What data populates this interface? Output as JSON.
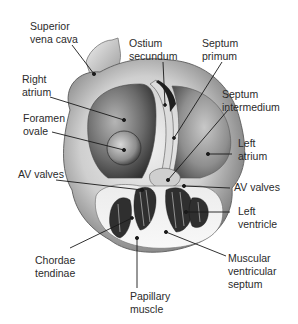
{
  "figure": {
    "colors": {
      "background": "#ffffff",
      "text": "#2b2b2b",
      "leader": "#1a1a1a",
      "tissue_light": "#e6e6e6",
      "tissue_mid": "#a8a8a8",
      "tissue_dark": "#3a3a3a"
    },
    "labels": [
      {
        "id": "superior-vena-cava",
        "lines": [
          "Superior",
          "vena cava"
        ]
      },
      {
        "id": "ostium-secundum",
        "lines": [
          "Ostium",
          "secundum"
        ]
      },
      {
        "id": "septum-primum",
        "lines": [
          "Septum",
          "primum"
        ]
      },
      {
        "id": "right-atrium",
        "lines": [
          "Right",
          "atrium"
        ]
      },
      {
        "id": "septum-intermedium",
        "lines": [
          "Septum",
          "intermedium"
        ]
      },
      {
        "id": "foramen-ovale",
        "lines": [
          "Foramen",
          "ovale"
        ]
      },
      {
        "id": "left-atrium",
        "lines": [
          "Left",
          "atrium"
        ]
      },
      {
        "id": "av-valves-left",
        "lines": [
          "AV valves"
        ]
      },
      {
        "id": "av-valves-right",
        "lines": [
          "AV valves"
        ]
      },
      {
        "id": "left-ventricle",
        "lines": [
          "Left",
          "ventricle"
        ]
      },
      {
        "id": "chordae-tendinae",
        "lines": [
          "Chordae",
          "tendinae"
        ]
      },
      {
        "id": "muscular-ventricular-septum",
        "lines": [
          "Muscular",
          "ventricular",
          "septum"
        ]
      },
      {
        "id": "papillary-muscle",
        "lines": [
          "Papillary",
          "muscle"
        ]
      }
    ]
  }
}
